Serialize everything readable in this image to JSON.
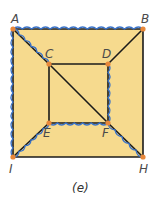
{
  "figure": {
    "caption": "(e)",
    "fill_color": "#F6DA8E",
    "edge_color": "#1a1a1a",
    "highlight_color": "#3a73c9",
    "vertex_color": "#E8883A"
  },
  "vertices": [
    {
      "id": "A",
      "label": "A",
      "x": 13,
      "y": 29
    },
    {
      "id": "B",
      "label": "B",
      "x": 143,
      "y": 29
    },
    {
      "id": "C",
      "label": "C",
      "x": 49,
      "y": 64
    },
    {
      "id": "D",
      "label": "D",
      "x": 108,
      "y": 64
    },
    {
      "id": "E",
      "label": "E",
      "x": 49,
      "y": 123
    },
    {
      "id": "F",
      "label": "F",
      "x": 108,
      "y": 123
    },
    {
      "id": "I",
      "label": "I",
      "x": 13,
      "y": 157
    },
    {
      "id": "H",
      "label": "H",
      "x": 143,
      "y": 157
    }
  ],
  "edges": [
    {
      "from": "A",
      "to": "B",
      "highlighted": true
    },
    {
      "from": "B",
      "to": "H",
      "highlighted": false
    },
    {
      "from": "H",
      "to": "I",
      "highlighted": false
    },
    {
      "from": "I",
      "to": "A",
      "highlighted": true
    },
    {
      "from": "C",
      "to": "D",
      "highlighted": false
    },
    {
      "from": "D",
      "to": "F",
      "highlighted": true
    },
    {
      "from": "F",
      "to": "E",
      "highlighted": true
    },
    {
      "from": "E",
      "to": "C",
      "highlighted": false
    },
    {
      "from": "A",
      "to": "C",
      "highlighted": true
    },
    {
      "from": "C",
      "to": "F",
      "highlighted": false
    },
    {
      "from": "F",
      "to": "H",
      "highlighted": true
    },
    {
      "from": "B",
      "to": "D",
      "highlighted": false
    },
    {
      "from": "I",
      "to": "E",
      "highlighted": true
    }
  ]
}
